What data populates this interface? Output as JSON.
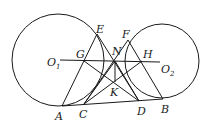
{
  "diagram": {
    "type": "geometry",
    "circles": [
      {
        "name": "O1",
        "cx": 58,
        "cy": 60,
        "r": 46
      },
      {
        "name": "O2",
        "cx": 162,
        "cy": 61,
        "r": 37
      }
    ],
    "points": {
      "A": [
        62,
        106
      ],
      "C": [
        84,
        104
      ],
      "D": [
        139,
        101
      ],
      "B": [
        163,
        99
      ],
      "E": [
        97,
        34
      ],
      "F": [
        128,
        40
      ],
      "G": [
        84,
        61
      ],
      "H": [
        142,
        61
      ],
      "N": [
        115,
        61
      ],
      "K": [
        115,
        82
      ],
      "O1": [
        60,
        60
      ],
      "O2": [
        160,
        62
      ]
    },
    "segments": [
      [
        "A",
        "B"
      ],
      [
        "O1",
        "O2"
      ],
      [
        "A",
        "E"
      ],
      [
        "E",
        "D"
      ],
      [
        "F",
        "C"
      ],
      [
        "F",
        "B"
      ],
      [
        "G",
        "D"
      ],
      [
        "C",
        "H"
      ],
      [
        "N",
        "K"
      ],
      [
        "N",
        "C"
      ],
      [
        "N",
        "D"
      ]
    ]
  },
  "labels": {
    "A": "A",
    "B": "B",
    "C": "C",
    "D": "D",
    "E": "E",
    "F": "F",
    "G": "G",
    "H": "H",
    "N": "N",
    "K": "K",
    "O1": "O",
    "O1_sub": "1",
    "O2": "O",
    "O2_sub": "2"
  }
}
